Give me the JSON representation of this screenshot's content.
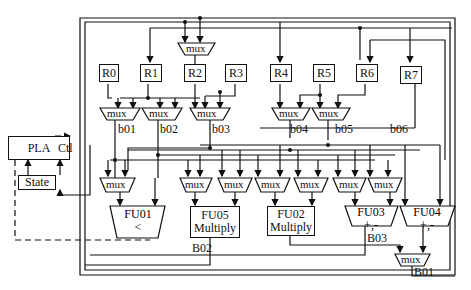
{
  "controller": {
    "pla_label": "PLA",
    "state_label": "State",
    "ctl_label": "Ctl"
  },
  "registers": [
    "R0",
    "R1",
    "R2",
    "R3",
    "R4",
    "R5",
    "R6",
    "R7"
  ],
  "mux_label": "mux",
  "local_buses": [
    "b01",
    "b02",
    "b03",
    "b04",
    "b05",
    "b06"
  ],
  "global_buses": [
    "B01",
    "B02",
    "B03"
  ],
  "functional_units": [
    {
      "id": "FU01",
      "op": "<"
    },
    {
      "id": "FU05",
      "op": "Multiply"
    },
    {
      "id": "FU02",
      "op": "Multiply"
    },
    {
      "id": "FU03",
      "op": "+,-"
    },
    {
      "id": "FU04",
      "op": "+,-"
    }
  ],
  "colors": {
    "line": "#111111",
    "background": "#ffffff"
  }
}
